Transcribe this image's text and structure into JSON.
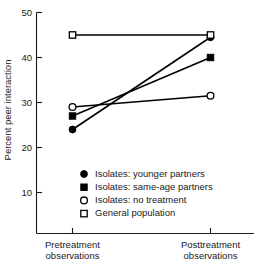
{
  "chart_data": {
    "type": "line",
    "title": "",
    "xlabel": "",
    "ylabel": "Percent peer interaction",
    "categories": [
      "Pretreatment observations",
      "Posttreatment observations"
    ],
    "category_lines": [
      [
        "Pretreatment",
        "observations"
      ],
      [
        "Posttreatment",
        "observations"
      ]
    ],
    "ylim": [
      0,
      50
    ],
    "yticks": [
      10,
      20,
      30,
      40,
      50
    ],
    "ytick_labels": [
      "10",
      "20",
      "30",
      "40",
      "50"
    ],
    "grid": false,
    "legend_position": "inside-lower-center",
    "series": [
      {
        "name": "Isolates: younger partners",
        "marker": "filled-circle",
        "color": "#000000",
        "values": [
          24,
          44.5
        ]
      },
      {
        "name": "Isolates: same-age partners",
        "marker": "filled-square",
        "color": "#000000",
        "values": [
          27,
          40
        ]
      },
      {
        "name": "Isolates: no treatment",
        "marker": "open-circle",
        "color": "#000000",
        "values": [
          29,
          31.5
        ]
      },
      {
        "name": "General population",
        "marker": "open-square",
        "color": "#000000",
        "values": [
          45,
          45
        ]
      }
    ]
  },
  "axis": {
    "y_label": "Percent peer interaction",
    "y_tick_10": "10",
    "y_tick_20": "20",
    "y_tick_30": "30",
    "y_tick_40": "40",
    "y_tick_50": "50",
    "x_cat_0_line1": "Pretreatment",
    "x_cat_0_line2": "observations",
    "x_cat_1_line1": "Posttreatment",
    "x_cat_1_line2": "observations"
  },
  "legend": {
    "items": [
      {
        "marker": "filled-circle",
        "label": "Isolates: younger partners"
      },
      {
        "marker": "filled-square",
        "label": "Isolates: same-age partners"
      },
      {
        "marker": "open-circle",
        "label": "Isolates: no treatment"
      },
      {
        "marker": "open-square",
        "label": "General population"
      }
    ]
  }
}
